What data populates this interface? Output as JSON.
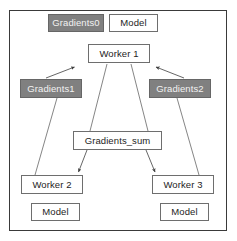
{
  "diagram": {
    "type": "flow-diagram",
    "frame": {
      "border_color": "#3a3a3a"
    },
    "palette": {
      "shaded_fill": "#808080",
      "shaded_text": "#f2f2f2",
      "plain_fill": "#ffffff",
      "node_border": "#6e6e6e",
      "edge_color": "#555555",
      "background": "#ffffff"
    },
    "nodes": [
      {
        "id": "gradients0",
        "label": "Gradients0",
        "style": "shaded"
      },
      {
        "id": "model0",
        "label": "Model",
        "style": "plain"
      },
      {
        "id": "worker1",
        "label": "Worker 1",
        "style": "plain"
      },
      {
        "id": "gradients1",
        "label": "Gradients1",
        "style": "shaded"
      },
      {
        "id": "gradients2",
        "label": "Gradients2",
        "style": "shaded"
      },
      {
        "id": "gradsum",
        "label": "Gradients_sum",
        "style": "plain"
      },
      {
        "id": "worker2",
        "label": "Worker 2",
        "style": "plain"
      },
      {
        "id": "worker3",
        "label": "Worker 3",
        "style": "plain"
      },
      {
        "id": "model2",
        "label": "Model",
        "style": "plain"
      },
      {
        "id": "model3",
        "label": "Model",
        "style": "plain"
      }
    ],
    "edges": [
      {
        "id": "e-grad1-worker1",
        "from": "gradients1",
        "to": "worker1",
        "arrow": "to"
      },
      {
        "id": "e-grad2-worker1",
        "from": "gradients2",
        "to": "worker1",
        "arrow": "to"
      },
      {
        "id": "e-worker1-gradsum",
        "from": "worker1",
        "to": "gradsum",
        "arrow": "none"
      },
      {
        "id": "e-worker1-right",
        "from": "worker1",
        "to": "worker3",
        "arrow": "none"
      },
      {
        "id": "e-grad1-worker2",
        "from": "gradients1",
        "to": "worker2",
        "arrow": "none"
      },
      {
        "id": "e-grad2-worker3",
        "from": "gradients2",
        "to": "worker3",
        "arrow": "none"
      },
      {
        "id": "e-gradsum-worker2",
        "from": "gradsum",
        "to": "worker2",
        "arrow": "to"
      },
      {
        "id": "e-gradsum-worker3",
        "from": "gradsum",
        "to": "worker3",
        "arrow": "to"
      }
    ]
  }
}
